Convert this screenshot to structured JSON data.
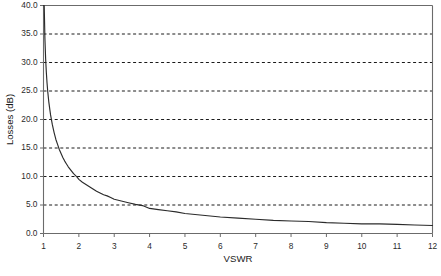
{
  "chart_data": {
    "type": "line",
    "title": "",
    "subtitle": "",
    "xlabel": "VSWR",
    "ylabel": "Losses (dB)",
    "xlim": [
      1,
      12
    ],
    "ylim": [
      0,
      40
    ],
    "grid": {
      "horizontal": true,
      "vertical": false,
      "style": "dashed"
    },
    "legend": {
      "visible": false,
      "position": "none"
    },
    "x_ticks": [
      1,
      2,
      3,
      4,
      5,
      6,
      7,
      8,
      9,
      10,
      11,
      12
    ],
    "x_tick_labels": [
      "1",
      "2",
      "3",
      "4",
      "5",
      "6",
      "7",
      "8",
      "9",
      "10",
      "11",
      "12"
    ],
    "y_ticks": [
      0,
      5,
      10,
      15,
      20,
      25,
      30,
      35,
      40
    ],
    "y_tick_labels": [
      "0.0",
      "5.0",
      "10.0",
      "15.0",
      "20.0",
      "25.0",
      "30.0",
      "35.0",
      "40.0"
    ],
    "series": [
      {
        "name": "Losses",
        "color": "#2b2b2b",
        "relation": "Return loss = -20*log10((VSWR-1)/(VSWR+1))",
        "x": [
          1.0,
          1.02,
          1.04,
          1.06,
          1.08,
          1.1,
          1.12,
          1.15,
          1.18,
          1.2,
          1.25,
          1.3,
          1.35,
          1.4,
          1.45,
          1.5,
          1.55,
          1.6,
          1.65,
          1.7,
          1.75,
          1.8,
          1.85,
          1.9,
          1.95,
          2.0,
          2.1,
          2.2,
          2.3,
          2.4,
          2.5,
          2.6,
          2.7,
          2.8,
          2.9,
          3.0,
          3.2,
          3.4,
          3.6,
          3.8,
          4.0,
          4.25,
          4.5,
          4.75,
          5.0,
          5.5,
          6.0,
          6.5,
          7.0,
          7.5,
          8.0,
          8.5,
          9.0,
          9.5,
          10.0,
          10.5,
          11.0,
          11.5,
          12.0
        ],
        "y": [
          40.0,
          40.0,
          34.2,
          30.7,
          28.3,
          26.4,
          24.9,
          23.1,
          21.7,
          20.8,
          19.1,
          17.7,
          16.5,
          15.6,
          14.7,
          14.0,
          13.3,
          12.7,
          12.2,
          11.7,
          11.3,
          10.9,
          10.5,
          10.2,
          9.9,
          9.5,
          9.0,
          8.6,
          8.2,
          7.8,
          7.4,
          7.1,
          6.8,
          6.6,
          6.3,
          6.0,
          5.7,
          5.4,
          5.1,
          4.9,
          4.4,
          4.2,
          4.0,
          3.8,
          3.5,
          3.2,
          2.9,
          2.7,
          2.5,
          2.3,
          2.2,
          2.1,
          1.9,
          1.8,
          1.7,
          1.7,
          1.6,
          1.5,
          1.4
        ]
      }
    ],
    "annotations": [],
    "colors": {
      "curve": "#2b2b2b",
      "axis": "#6b6b6b",
      "grid": "#1a1a1a",
      "background": "#ffffff",
      "text": "#1a1a1a"
    }
  }
}
